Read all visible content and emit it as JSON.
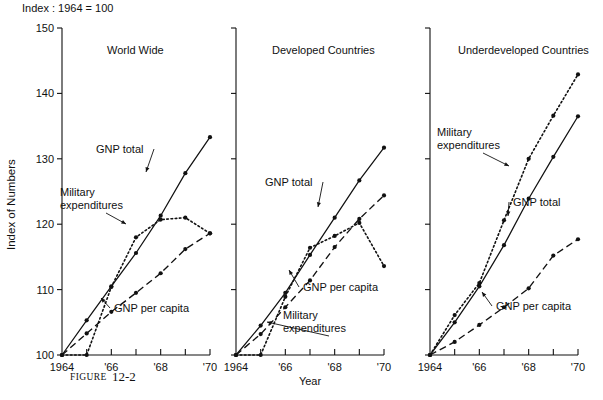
{
  "figure": {
    "index_note": "Index : 1964 = 100",
    "y_axis_title": "Index of Numbers",
    "x_axis_title": "Year",
    "caption_label": "FIGURE",
    "caption_number": "12-2"
  },
  "axes": {
    "y_ticks": [
      "100",
      "110",
      "120",
      "130",
      "140",
      "150"
    ],
    "y_values": [
      100,
      110,
      120,
      130,
      140,
      150
    ],
    "x_ticks": [
      "1964",
      "",
      "'66",
      "",
      "'68",
      "",
      "'70"
    ],
    "x_values": [
      1964,
      1965,
      1966,
      1967,
      1968,
      1969,
      1970
    ],
    "ylim": [
      100,
      150
    ],
    "xlim": [
      1964,
      1970
    ],
    "grid": false
  },
  "series_labels": {
    "gnp_total": "GNP total",
    "military": "Military\nexpenditures",
    "military_line1": "Military",
    "military_line2": "expenditures",
    "gnp_per_capita": "GNP per capita"
  },
  "chart_data": [
    {
      "type": "line",
      "title": "World Wide",
      "xlabel": "Year",
      "ylabel": "Index of Numbers",
      "xlim": [
        1964,
        1970
      ],
      "ylim": [
        100,
        150
      ],
      "x": [
        1964,
        1965,
        1966,
        1967,
        1968,
        1969,
        1970
      ],
      "grid": false,
      "legend": "inline-annotations",
      "series": [
        {
          "name": "GNP total",
          "style": "solid",
          "values": [
            100,
            105.3,
            110.5,
            115.6,
            121.3,
            127.8,
            133.3
          ]
        },
        {
          "name": "Military expenditures",
          "style": "dotted",
          "values": [
            100,
            100.0,
            110.4,
            118.0,
            120.7,
            121.0,
            118.6
          ]
        },
        {
          "name": "GNP per capita",
          "style": "dashed",
          "values": [
            100,
            103.3,
            106.6,
            109.5,
            112.5,
            116.2,
            118.6
          ]
        }
      ]
    },
    {
      "type": "line",
      "title": "Developed Countries",
      "xlabel": "Year",
      "ylabel": "Index of Numbers",
      "xlim": [
        1964,
        1970
      ],
      "ylim": [
        100,
        150
      ],
      "x": [
        1964,
        1965,
        1966,
        1967,
        1968,
        1969,
        1970
      ],
      "grid": false,
      "legend": "inline-annotations",
      "series": [
        {
          "name": "GNP total",
          "style": "solid",
          "values": [
            100,
            104.5,
            109.5,
            115.3,
            121.0,
            126.7,
            131.7
          ]
        },
        {
          "name": "Military expenditures",
          "style": "dotted",
          "values": [
            100,
            100.0,
            108.9,
            116.4,
            118.2,
            120.2,
            113.6
          ]
        },
        {
          "name": "GNP per capita",
          "style": "dashed",
          "values": [
            100,
            103.2,
            107.3,
            111.4,
            116.5,
            120.8,
            124.4
          ]
        }
      ]
    },
    {
      "type": "line",
      "title": "Underdeveloped Countries",
      "xlabel": "Year",
      "ylabel": "Index of Numbers",
      "xlim": [
        1964,
        1970
      ],
      "ylim": [
        100,
        150
      ],
      "x": [
        1964,
        1965,
        1966,
        1967,
        1968,
        1969,
        1970
      ],
      "grid": false,
      "legend": "inline-annotations",
      "series": [
        {
          "name": "GNP total",
          "style": "solid",
          "values": [
            100,
            105.0,
            110.5,
            116.8,
            123.9,
            130.3,
            136.5
          ]
        },
        {
          "name": "Military expenditures",
          "style": "dotted",
          "values": [
            100,
            106.1,
            111.0,
            120.6,
            130.0,
            136.6,
            142.9
          ]
        },
        {
          "name": "GNP per capita",
          "style": "dashed",
          "values": [
            100,
            102.0,
            104.6,
            107.3,
            110.2,
            115.2,
            117.7
          ]
        }
      ]
    }
  ],
  "annotations": [
    {
      "panel": 0,
      "series": "GNP total",
      "text": "GNP total",
      "tx": 96,
      "ty": 153,
      "ax": 146,
      "ay": 172
    },
    {
      "panel": 0,
      "series": "Military expenditures",
      "text_line1": "Military",
      "text_line2": "expenditures",
      "tx": 60,
      "ty": 196,
      "ax": 126,
      "ay": 224
    },
    {
      "panel": 0,
      "series": "GNP per capita",
      "text": "GNP per capita",
      "tx": 114,
      "ty": 312,
      "ax": 101,
      "ay": 298
    },
    {
      "panel": 1,
      "series": "GNP total",
      "text": "GNP total",
      "tx": 265,
      "ty": 186,
      "ax": 318,
      "ay": 207
    },
    {
      "panel": 1,
      "series": "Military expenditures",
      "text_line1": "Military",
      "text_line2": "expenditures",
      "tx": 283,
      "ty": 319,
      "ax": 267,
      "ay": 322
    },
    {
      "panel": 1,
      "series": "GNP per capita",
      "text": "GNP per capita",
      "tx": 303,
      "ty": 291,
      "ax": 289,
      "ay": 270
    },
    {
      "panel": 2,
      "series": "Military expenditures",
      "text_line1": "Military",
      "text_line2": "expenditures",
      "tx": 437,
      "ty": 136,
      "ax": 509,
      "ay": 166
    },
    {
      "panel": 2,
      "series": "GNP total",
      "text": "GNP total",
      "tx": 513,
      "ty": 206,
      "ax": 508,
      "ay": 216
    },
    {
      "panel": 2,
      "series": "GNP per capita",
      "text": "GNP per capita",
      "tx": 496,
      "ty": 310,
      "ax": 482,
      "ay": 292
    }
  ],
  "panel_geometry": [
    {
      "x0": 62,
      "x1": 210,
      "title_x": 107,
      "title_y": 54
    },
    {
      "x0": 236,
      "x1": 384,
      "title_x": 272,
      "title_y": 54
    },
    {
      "x0": 430,
      "x1": 578,
      "title_x": 458,
      "title_y": 54
    }
  ],
  "colors": {
    "ink": "#111111",
    "background": "#ffffff"
  }
}
